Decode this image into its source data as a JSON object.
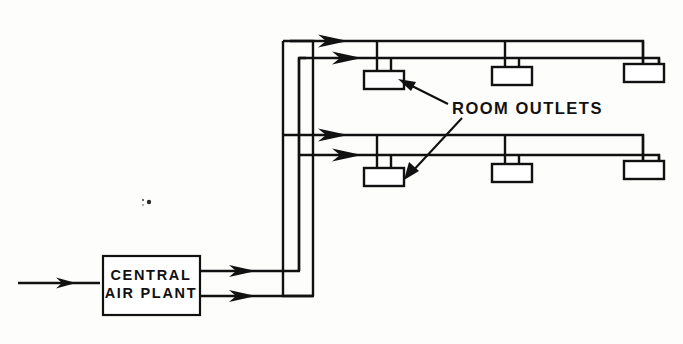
{
  "diagram": {
    "background_color": "#fdfdfc",
    "line_color": "#111111",
    "labels": {
      "plant_line1": "CENTRAL",
      "plant_line2": "AIR PLANT",
      "callout": "ROOM OUTLETS"
    },
    "plant": {
      "name": "central-air-plant",
      "x": 103,
      "y": 256,
      "width": 97,
      "height": 59
    },
    "inlet": {
      "name": "supply-air-inlet",
      "from_x": 18,
      "to_x": 103,
      "y": 283
    },
    "risers": [
      {
        "name": "outer-riser",
        "x": 283,
        "top_y": 41,
        "bottom_y": 296
      },
      {
        "name": "inner-riser",
        "x": 299,
        "top_y": 58,
        "bottom_y": 271
      }
    ],
    "plant_outlets": [
      {
        "name": "plant-outlet-upper",
        "y": 271,
        "from_x": 200,
        "to_x": 299
      },
      {
        "name": "plant-outlet-lower",
        "y": 296,
        "from_x": 200,
        "to_x": 283
      }
    ],
    "branch_feeds": [
      {
        "name": "branch-feed-upper-level",
        "y": 135,
        "from_x": 283,
        "to_x": 369
      },
      {
        "name": "branch-feed-lower-level",
        "y": 155,
        "from_x": 299,
        "to_x": 369
      }
    ],
    "ducts": [
      {
        "name": "duct-upper-level-primary",
        "y": 41,
        "from_x": 283,
        "to_x": 643
      },
      {
        "name": "duct-upper-level-secondary",
        "y": 58,
        "from_x": 299,
        "to_x": 659
      },
      {
        "name": "duct-lower-level-primary",
        "y": 135,
        "from_x": 283,
        "to_x": 643
      },
      {
        "name": "duct-lower-level-secondary",
        "y": 155,
        "from_x": 299,
        "to_x": 659
      }
    ],
    "outlet_boxes": [
      {
        "name": "outlet-upper-1",
        "x": 364,
        "y": 71,
        "width": 40,
        "height": 18,
        "level": "upper"
      },
      {
        "name": "outlet-upper-2",
        "x": 492,
        "y": 67,
        "width": 40,
        "height": 18,
        "level": "upper"
      },
      {
        "name": "outlet-upper-3",
        "x": 624,
        "y": 64,
        "width": 40,
        "height": 18,
        "level": "upper"
      },
      {
        "name": "outlet-lower-1",
        "x": 364,
        "y": 168,
        "width": 40,
        "height": 18,
        "level": "lower"
      },
      {
        "name": "outlet-lower-2",
        "x": 492,
        "y": 164,
        "width": 40,
        "height": 18,
        "level": "lower"
      },
      {
        "name": "outlet-lower-3",
        "x": 624,
        "y": 161,
        "width": 40,
        "height": 18,
        "level": "lower"
      }
    ],
    "callout": {
      "name": "room-outlets-callout",
      "text_x": 452,
      "text_y": 114,
      "leaders": [
        {
          "name": "leader-to-upper-outlet",
          "x1": 448,
          "y1": 104,
          "x2": 400,
          "y2": 81
        },
        {
          "name": "leader-to-lower-outlet",
          "x1": 462,
          "y1": 118,
          "x2": 406,
          "y2": 177
        }
      ]
    },
    "arrow_count": 7,
    "outlet_count": 6,
    "level_count": 2
  }
}
